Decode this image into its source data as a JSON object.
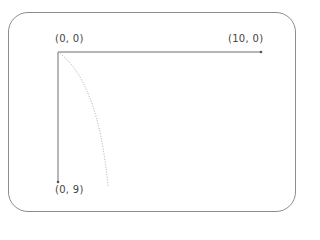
{
  "diagram": {
    "labels": {
      "origin": "(0, 0)",
      "x_end": "(10, 0)",
      "y_end": "(0, 9)"
    },
    "colors": {
      "border": "#8c8c8c",
      "axis": "#6e6e6e",
      "curve": "#aaaaaa",
      "text": "#444444"
    },
    "axes": {
      "origin_px": [
        58,
        52
      ],
      "x_end_px": [
        261,
        52
      ],
      "y_end_px": [
        58,
        182
      ]
    },
    "curve": {
      "style": "dotted",
      "from_px": [
        58,
        52
      ],
      "to_px": [
        108,
        186
      ]
    }
  }
}
